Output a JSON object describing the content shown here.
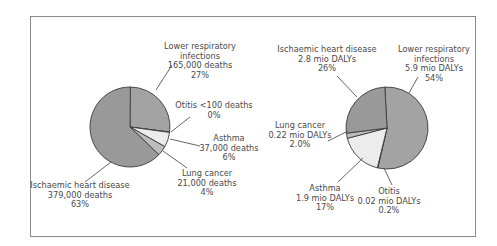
{
  "chart_data": [
    {
      "type": "pie",
      "title": "",
      "unit": "deaths",
      "categories": [
        "Lower respiratory infections",
        "Otitis",
        "Asthma",
        "Lung cancer",
        "Ischaemic heart disease"
      ],
      "values": [
        165000,
        100,
        37000,
        21000,
        379000
      ],
      "percent": [
        27,
        0,
        6,
        4,
        63
      ],
      "colors": [
        "#a3a3a3",
        "#ececec",
        "#ececec",
        "#bdbdbd",
        "#999999"
      ],
      "labels": [
        [
          "Lower respiratory",
          "infections",
          "165,000 deaths",
          "27%"
        ],
        [
          "Otitis <100 deaths",
          "0%"
        ],
        [
          "Asthma",
          "37,000 deaths",
          "6%"
        ],
        [
          "Lung cancer",
          "21,000 deaths",
          "4%"
        ],
        [
          "Ischaemic heart disease",
          "379,000 deaths",
          "63%"
        ]
      ]
    },
    {
      "type": "pie",
      "title": "",
      "unit": "mio DALYs",
      "categories": [
        "Lower respiratory infections",
        "Otitis",
        "Asthma",
        "Lung cancer",
        "Ischaemic heart disease"
      ],
      "values": [
        5.9,
        0.02,
        1.9,
        0.22,
        2.8
      ],
      "percent": [
        54,
        0.2,
        17,
        2.0,
        26
      ],
      "colors": [
        "#a3a3a3",
        "#ececec",
        "#ececec",
        "#bdbdbd",
        "#999999"
      ],
      "labels": [
        [
          "Lower respiratory",
          "infections",
          "5.9 mio DALYs",
          "54%"
        ],
        [
          "Otitis",
          "0.02 mio DALYs",
          "0.2%"
        ],
        [
          "Asthma",
          "1.9 mio DALYs",
          "17%"
        ],
        [
          "Lung cancer",
          "0.22 mio DALYs",
          "2.0%"
        ],
        [
          "Ischaemic heart disease",
          "2.8 mio DALYs",
          "26%"
        ]
      ]
    }
  ]
}
